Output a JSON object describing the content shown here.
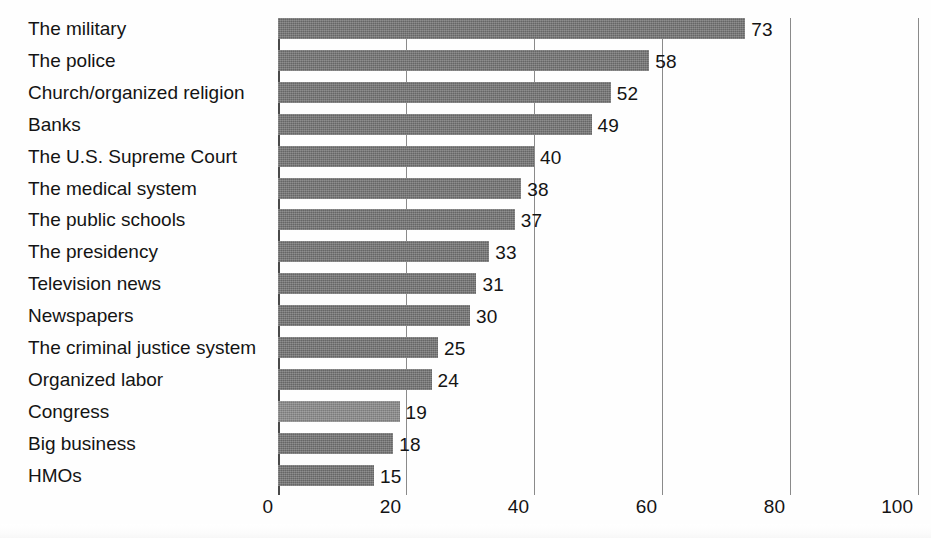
{
  "chart_data": {
    "type": "bar",
    "orientation": "horizontal",
    "title": "",
    "subtitle": "",
    "xlabel": "",
    "ylabel": "",
    "xlim": [
      0,
      100
    ],
    "ylim": null,
    "grid": true,
    "gridlines_axis": "x",
    "legend": null,
    "legend_position": "none",
    "tick_labels": [
      "0",
      "20",
      "40",
      "60",
      "80",
      "100"
    ],
    "ticks": [
      0,
      20,
      40,
      60,
      80,
      100
    ],
    "categories": [
      "The military",
      "The police",
      "Church/organized religion",
      "Banks",
      "The U.S. Supreme Court",
      "The medical system",
      "The public schools",
      "The presidency",
      "Television news",
      "Newspapers",
      "The criminal justice system",
      "Organized labor",
      "Congress",
      "Big business",
      "HMOs"
    ],
    "values": [
      73,
      58,
      52,
      49,
      40,
      38,
      37,
      33,
      31,
      30,
      25,
      24,
      19,
      18,
      15
    ],
    "value_labels": [
      "73",
      "58",
      "52",
      "49",
      "40",
      "38",
      "37",
      "33",
      "31",
      "30",
      "25",
      "24",
      "19",
      "18",
      "15"
    ],
    "highlight_index": 12,
    "colors": {
      "bar": "#6f6f6f",
      "bar_highlight": "#868686",
      "gridline": "#8a8a8a",
      "axis": "#4a4a4a",
      "text": "#141414",
      "background": "#ffffff"
    }
  }
}
